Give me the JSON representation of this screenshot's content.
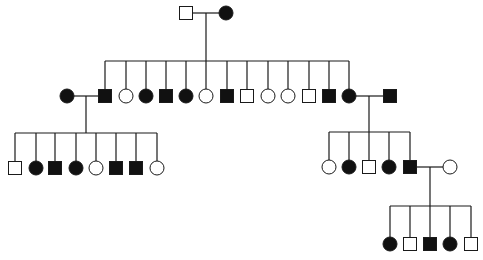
{
  "diagram": {
    "type": "pedigree",
    "colors": {
      "line": "#1a1a1a",
      "affected": "#111111",
      "unaffected": "#ffffff"
    },
    "symbol_size": 13,
    "generations": [
      {
        "id": "I",
        "couples": [
          {
            "id": "I-couple",
            "y": 13,
            "parents": [
              {
                "sex": "male",
                "affected": false,
                "x": 186
              },
              {
                "sex": "female",
                "affected": true,
                "x": 226
              }
            ],
            "drop_x": 206
          }
        ]
      },
      {
        "id": "II",
        "sibship": {
          "parent_couple": "I-couple",
          "bar_y": 61,
          "y": 96,
          "children": [
            {
              "sex": "male",
              "affected": true,
              "x": 105
            },
            {
              "sex": "female",
              "affected": false,
              "x": 126
            },
            {
              "sex": "female",
              "affected": true,
              "x": 146
            },
            {
              "sex": "male",
              "affected": true,
              "x": 166
            },
            {
              "sex": "female",
              "affected": true,
              "x": 186
            },
            {
              "sex": "female",
              "affected": false,
              "x": 206
            },
            {
              "sex": "male",
              "affected": true,
              "x": 227
            },
            {
              "sex": "male",
              "affected": false,
              "x": 247
            },
            {
              "sex": "female",
              "affected": false,
              "x": 268
            },
            {
              "sex": "female",
              "affected": false,
              "x": 288
            },
            {
              "sex": "male",
              "affected": false,
              "x": 309
            },
            {
              "sex": "male",
              "affected": true,
              "x": 329
            },
            {
              "sex": "female",
              "affected": true,
              "x": 349
            }
          ]
        },
        "spouses": [
          {
            "id": "II-left-couple",
            "spouse": {
              "sex": "female",
              "affected": true,
              "x": 67
            },
            "partner_x": 105,
            "drop_x": 86
          },
          {
            "id": "II-right-couple",
            "spouse": {
              "sex": "male",
              "affected": true,
              "x": 390
            },
            "partner_x": 349,
            "drop_x": 369
          }
        ]
      },
      {
        "id": "III",
        "sibships": [
          {
            "parent_couple": "II-left-couple",
            "bar_y": 133,
            "y": 168,
            "children": [
              {
                "sex": "male",
                "affected": false,
                "x": 15
              },
              {
                "sex": "female",
                "affected": true,
                "x": 36
              },
              {
                "sex": "male",
                "affected": true,
                "x": 55
              },
              {
                "sex": "female",
                "affected": true,
                "x": 76
              },
              {
                "sex": "female",
                "affected": false,
                "x": 96
              },
              {
                "sex": "male",
                "affected": true,
                "x": 116
              },
              {
                "sex": "male",
                "affected": true,
                "x": 136
              },
              {
                "sex": "female",
                "affected": false,
                "x": 157
              }
            ]
          },
          {
            "parent_couple": "II-right-couple",
            "bar_y": 132,
            "y": 167,
            "children": [
              {
                "sex": "female",
                "affected": false,
                "x": 329
              },
              {
                "sex": "female",
                "affected": true,
                "x": 349
              },
              {
                "sex": "male",
                "affected": false,
                "x": 369
              },
              {
                "sex": "female",
                "affected": true,
                "x": 389
              },
              {
                "sex": "male",
                "affected": true,
                "x": 410
              }
            ]
          }
        ],
        "spouses": [
          {
            "id": "III-couple",
            "spouse": {
              "sex": "female",
              "affected": false,
              "x": 450
            },
            "partner_x": 410,
            "y": 167,
            "drop_x": 430
          }
        ]
      },
      {
        "id": "IV",
        "sibship": {
          "parent_couple": "III-couple",
          "bar_y": 206,
          "y": 244,
          "children": [
            {
              "sex": "female",
              "affected": true,
              "x": 390
            },
            {
              "sex": "male",
              "affected": false,
              "x": 410
            },
            {
              "sex": "male",
              "affected": true,
              "x": 430
            },
            {
              "sex": "female",
              "affected": true,
              "x": 450
            },
            {
              "sex": "male",
              "affected": false,
              "x": 471
            }
          ]
        }
      }
    ]
  }
}
